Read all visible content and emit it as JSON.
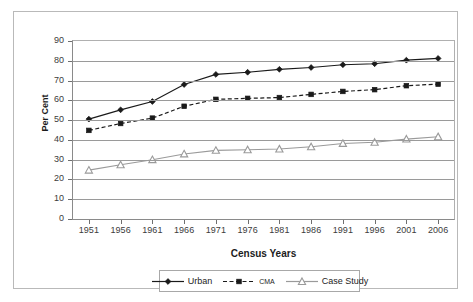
{
  "chart_data": {
    "type": "line",
    "title": "",
    "xlabel": "Census Years",
    "ylabel": "Per Cent",
    "categories": [
      "1951",
      "1956",
      "1961",
      "1966",
      "1971",
      "1976",
      "1981",
      "1986",
      "1991",
      "1996",
      "2001",
      "2006"
    ],
    "ylim": [
      0,
      90
    ],
    "ytick_values": [
      0,
      10,
      20,
      30,
      40,
      50,
      60,
      70,
      80,
      90
    ],
    "ytick_labels": [
      "0",
      "10",
      "20",
      "30",
      "40",
      "50",
      "60",
      "70",
      "80",
      "90"
    ],
    "grid": true,
    "legend_position": "bottom",
    "series": [
      {
        "name": "Urban",
        "color": "#1a1a1a",
        "marker": "diamond",
        "dash": "solid",
        "values": [
          50.5,
          55.2,
          59.4,
          68.0,
          73.1,
          74.2,
          75.7,
          76.6,
          78.0,
          78.5,
          80.3,
          81.2
        ]
      },
      {
        "name": "CMA",
        "color": "#1a1a1a",
        "marker": "square",
        "dash": "dashed",
        "values": [
          44.8,
          48.3,
          51.0,
          57.0,
          60.5,
          61.0,
          61.4,
          63.0,
          64.5,
          65.4,
          67.4,
          68.2
        ]
      },
      {
        "name": "Case Study",
        "color": "#9a9a9a",
        "marker": "triangle",
        "dash": "solid",
        "values": [
          24.7,
          27.4,
          30.0,
          32.9,
          34.7,
          35.0,
          35.4,
          36.5,
          38.2,
          38.8,
          40.4,
          41.6
        ]
      }
    ]
  },
  "legend": {
    "entries": [
      {
        "label": "Urban"
      },
      {
        "label": "CMA"
      },
      {
        "label": "Case Study"
      }
    ]
  },
  "colors": {
    "urban": "#1a1a1a",
    "cma": "#1a1a1a",
    "case_study": "#9a9a9a",
    "gridline": "#9a9a9a",
    "frame": "#b9b9b9",
    "background": "#ffffff"
  }
}
